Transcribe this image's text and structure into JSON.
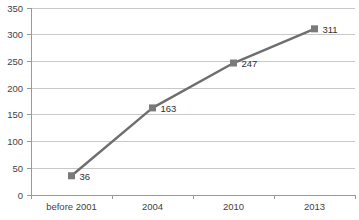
{
  "chart_data": {
    "type": "line",
    "title": "",
    "subtitle": "",
    "xlabel": "",
    "ylabel": "",
    "categories": [
      "before 2001",
      "2004",
      "2010",
      "2013"
    ],
    "values": [
      36,
      163,
      247,
      311
    ],
    "point_labels": [
      "36",
      "163",
      "247",
      "311"
    ],
    "series": [
      {
        "name": "",
        "values": [
          36,
          163,
          247,
          311
        ]
      }
    ],
    "ylim": [
      0,
      350
    ],
    "y_ticks": [
      0,
      50,
      100,
      150,
      200,
      250,
      300,
      350
    ],
    "y_tick_labels": [
      "0",
      "50",
      "100",
      "150",
      "200",
      "250",
      "300",
      "350"
    ],
    "x_tick_labels": [
      "before 2001",
      "2004",
      "2010",
      "2013"
    ],
    "grid": true,
    "grid_axis": "y",
    "legend": false,
    "legend_position": "none",
    "marker": "square",
    "colors": {
      "line": "#6e6e6e",
      "marker": "#7a7a7a",
      "grid": "#c8c8c8",
      "axis": "#9a9a9a",
      "text": "#3f3f3f",
      "background": "#ffffff"
    }
  }
}
